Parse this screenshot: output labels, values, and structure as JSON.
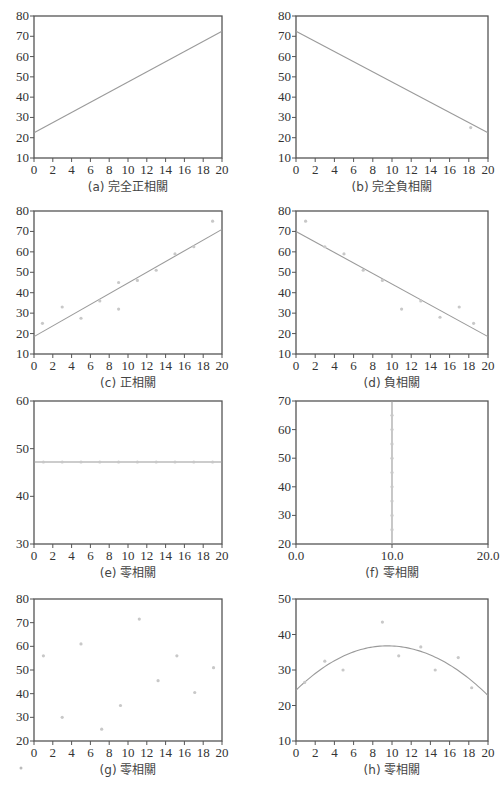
{
  "figure": {
    "stray_mark": {
      "x": 21,
      "y": 768
    }
  },
  "chart_data": [
    {
      "id": "a",
      "type": "line",
      "caption": "(a) 完全正相關",
      "xlim": [
        0,
        20
      ],
      "ylim": [
        10,
        80
      ],
      "xticks": [
        0,
        2,
        4,
        6,
        8,
        10,
        12,
        14,
        16,
        18,
        20
      ],
      "yticks": [
        10,
        20,
        30,
        40,
        50,
        60,
        70,
        80
      ],
      "xtick_labels": [
        "0",
        "2",
        "4",
        "6",
        "8",
        "10",
        "12",
        "14",
        "16",
        "18",
        "20"
      ],
      "points": [],
      "line": {
        "x": [
          0,
          20
        ],
        "y": [
          22.5,
          72.5
        ]
      },
      "box": {
        "x": 34,
        "y": 16,
        "w": 188,
        "h": 142
      }
    },
    {
      "id": "b",
      "type": "line",
      "caption": "(b) 完全負相關",
      "xlim": [
        0,
        20
      ],
      "ylim": [
        10,
        80
      ],
      "xticks": [
        0,
        2,
        4,
        6,
        8,
        10,
        12,
        14,
        16,
        18,
        20
      ],
      "yticks": [
        10,
        20,
        30,
        40,
        50,
        60,
        70,
        80
      ],
      "xtick_labels": [
        "0",
        "2",
        "4",
        "6",
        "8",
        "10",
        "12",
        "14",
        "16",
        "18",
        "20"
      ],
      "points": [
        [
          18.2,
          25
        ]
      ],
      "line": {
        "x": [
          0,
          20
        ],
        "y": [
          72.5,
          22.5
        ]
      },
      "box": {
        "x": 296,
        "y": 16,
        "w": 192,
        "h": 142
      }
    },
    {
      "id": "c",
      "type": "scatter",
      "caption": "(c) 正相關",
      "xlim": [
        0,
        20
      ],
      "ylim": [
        10,
        80
      ],
      "xticks": [
        0,
        2,
        4,
        6,
        8,
        10,
        12,
        14,
        16,
        18,
        20
      ],
      "yticks": [
        10,
        20,
        30,
        40,
        50,
        60,
        70,
        80
      ],
      "xtick_labels": [
        "0",
        "2",
        "4",
        "6",
        "8",
        "10",
        "12",
        "14",
        "16",
        "18",
        "20"
      ],
      "points": [
        [
          0.9,
          25
        ],
        [
          3,
          33
        ],
        [
          5,
          27.5
        ],
        [
          7,
          36
        ],
        [
          9,
          45
        ],
        [
          9,
          32
        ],
        [
          11,
          46
        ],
        [
          13,
          51
        ],
        [
          15,
          59
        ],
        [
          17,
          62.5
        ],
        [
          19,
          75
        ]
      ],
      "line": {
        "x": [
          0,
          20
        ],
        "y": [
          18.5,
          71
        ]
      },
      "box": {
        "x": 34,
        "y": 211,
        "w": 188,
        "h": 143
      }
    },
    {
      "id": "d",
      "type": "scatter",
      "caption": "(d) 負相關",
      "xlim": [
        0,
        20
      ],
      "ylim": [
        10,
        80
      ],
      "xticks": [
        0,
        2,
        4,
        6,
        8,
        10,
        12,
        14,
        16,
        18,
        20
      ],
      "yticks": [
        10,
        20,
        30,
        40,
        50,
        60,
        70,
        80
      ],
      "xtick_labels": [
        "0",
        "2",
        "4",
        "6",
        "8",
        "10",
        "12",
        "14",
        "16",
        "18",
        "20"
      ],
      "points": [
        [
          1,
          75
        ],
        [
          3,
          62.5
        ],
        [
          5,
          59
        ],
        [
          7,
          51
        ],
        [
          9,
          46
        ],
        [
          11,
          32
        ],
        [
          13,
          36
        ],
        [
          15,
          28
        ],
        [
          17,
          33
        ],
        [
          18.5,
          25
        ]
      ],
      "line": {
        "x": [
          0,
          20
        ],
        "y": [
          70,
          18.5
        ]
      },
      "box": {
        "x": 296,
        "y": 211,
        "w": 192,
        "h": 143
      }
    },
    {
      "id": "e",
      "type": "scatter",
      "caption": "(e) 零相關",
      "xlim": [
        0,
        20
      ],
      "ylim": [
        30,
        60
      ],
      "xticks": [
        0,
        2,
        4,
        6,
        8,
        10,
        12,
        14,
        16,
        18,
        20
      ],
      "yticks": [
        30,
        40,
        50,
        60
      ],
      "xtick_labels": [
        "0",
        "2",
        "4",
        "6",
        "8",
        "10",
        "12",
        "14",
        "16",
        "18",
        "20"
      ],
      "points": [
        [
          1,
          47.2
        ],
        [
          3,
          47.2
        ],
        [
          5,
          47.2
        ],
        [
          7,
          47.2
        ],
        [
          9,
          47.2
        ],
        [
          11,
          47.2
        ],
        [
          13,
          47.2
        ],
        [
          15,
          47.2
        ],
        [
          17,
          47.2
        ],
        [
          19,
          47.2
        ]
      ],
      "line": {
        "x": [
          0,
          20
        ],
        "y": [
          47.2,
          47.2
        ]
      },
      "box": {
        "x": 34,
        "y": 401,
        "w": 188,
        "h": 143
      }
    },
    {
      "id": "f",
      "type": "scatter",
      "caption": "(f) 零相關",
      "xlim": [
        0,
        20
      ],
      "ylim": [
        20,
        70
      ],
      "xticks": [
        0,
        10,
        20
      ],
      "yticks": [
        20,
        30,
        40,
        50,
        60,
        70
      ],
      "xtick_labels": [
        "0.0",
        "10.0",
        "20.0"
      ],
      "points": [
        [
          10,
          25
        ],
        [
          10,
          30
        ],
        [
          10,
          35
        ],
        [
          10,
          40
        ],
        [
          10,
          45
        ],
        [
          10,
          50
        ],
        [
          10,
          55
        ],
        [
          10,
          60
        ],
        [
          10,
          65
        ]
      ],
      "line": {
        "x": [
          10,
          10
        ],
        "y": [
          20,
          70
        ]
      },
      "box": {
        "x": 296,
        "y": 401,
        "w": 192,
        "h": 143
      }
    },
    {
      "id": "g",
      "type": "scatter",
      "caption": "(g) 零相關",
      "xlim": [
        0,
        20
      ],
      "ylim": [
        20,
        80
      ],
      "xticks": [
        0,
        2,
        4,
        6,
        8,
        10,
        12,
        14,
        16,
        18,
        20
      ],
      "yticks": [
        20,
        30,
        40,
        50,
        60,
        70,
        80
      ],
      "xtick_labels": [
        "0",
        "2",
        "4",
        "6",
        "8",
        "10",
        "12",
        "14",
        "16",
        "18",
        "20"
      ],
      "points": [
        [
          1,
          56
        ],
        [
          3,
          30
        ],
        [
          5,
          61
        ],
        [
          7.2,
          25
        ],
        [
          9.2,
          35
        ],
        [
          11.2,
          71.5
        ],
        [
          13.2,
          45.5
        ],
        [
          15.2,
          56
        ],
        [
          17.1,
          40.5
        ],
        [
          19.1,
          51
        ]
      ],
      "line": null,
      "box": {
        "x": 34,
        "y": 599,
        "w": 188,
        "h": 142
      }
    },
    {
      "id": "h",
      "type": "scatter",
      "caption": "(h) 零相關",
      "xlim": [
        0,
        20
      ],
      "ylim": [
        10,
        50
      ],
      "xticks": [
        0,
        2,
        4,
        6,
        8,
        10,
        12,
        14,
        16,
        18,
        20
      ],
      "yticks": [
        10,
        20,
        30,
        40,
        50
      ],
      "xtick_labels": [
        "0",
        "2",
        "4",
        "6",
        "8",
        "10",
        "12",
        "14",
        "16",
        "18",
        "20"
      ],
      "points": [
        [
          0.9,
          26.5
        ],
        [
          3,
          32.5
        ],
        [
          4.9,
          30
        ],
        [
          9,
          43.5
        ],
        [
          10.7,
          34
        ],
        [
          13,
          36.5
        ],
        [
          14.5,
          30
        ],
        [
          16.9,
          33.5
        ],
        [
          18.3,
          25
        ]
      ],
      "curve": {
        "type": "quadratic",
        "vertex_x": 9.5,
        "vertex_y": 36.8,
        "y_at_0": 24.3,
        "y_at_20": 22.8
      },
      "box": {
        "x": 296,
        "y": 599,
        "w": 192,
        "h": 142
      }
    }
  ]
}
